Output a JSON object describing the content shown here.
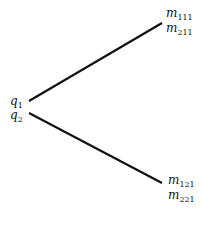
{
  "diagram": {
    "root": {
      "labels": [
        {
          "base": "q",
          "sub": "1"
        },
        {
          "base": "q",
          "sub": "2"
        }
      ]
    },
    "branches": [
      {
        "id": "upper",
        "labels": [
          {
            "base": "m",
            "sub": "111"
          },
          {
            "base": "m",
            "sub": "211"
          }
        ]
      },
      {
        "id": "lower",
        "labels": [
          {
            "base": "m",
            "sub": "121"
          },
          {
            "base": "m",
            "sub": "221"
          }
        ]
      }
    ],
    "line_color": "#111111"
  }
}
